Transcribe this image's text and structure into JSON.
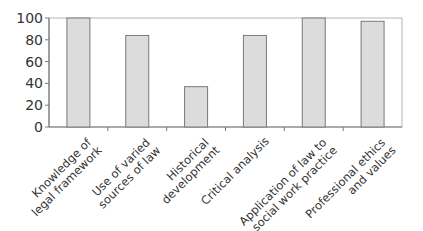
{
  "chart_data": {
    "type": "bar",
    "title": "",
    "xlabel": "",
    "ylabel": "",
    "ylim": [
      0,
      100
    ],
    "yticks": [
      0,
      20,
      40,
      60,
      80,
      100
    ],
    "grid": false,
    "legend": null,
    "categories": [
      [
        "Knowledge of",
        "legal framework"
      ],
      [
        "Use of varied",
        "sources of law"
      ],
      [
        "Historical",
        "development"
      ],
      [
        "Critical analysis"
      ],
      [
        "Application of law to",
        "social work practice"
      ],
      [
        "Professional ethics",
        "and values"
      ]
    ],
    "values": [
      100,
      84,
      37,
      84,
      100,
      97
    ],
    "colors": {
      "bar_fill": "#dcdcdc",
      "bar_stroke": "#7a7a7a",
      "axis": "#7a7a7a",
      "frame": "#b5b5b5"
    }
  }
}
